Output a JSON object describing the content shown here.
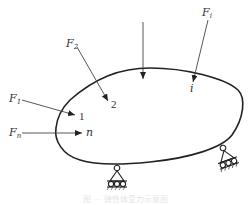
{
  "diagram": {
    "type": "elastic-body-with-applied-forces",
    "colors": {
      "stroke": "#222222",
      "text": "#333333"
    },
    "forces": [
      {
        "id": "F1",
        "label": "F",
        "subscript": "1",
        "point_label": "1"
      },
      {
        "id": "F2",
        "label": "F",
        "subscript": "2",
        "point_label": "2"
      },
      {
        "id": "Fi",
        "label": "F",
        "subscript": "i",
        "point_label": "i"
      },
      {
        "id": "Fn",
        "label": "F",
        "subscript": "n",
        "point_label": "n"
      },
      {
        "id": "F_unlabeled",
        "label": "",
        "subscript": "",
        "point_label": ""
      }
    ],
    "supports": [
      {
        "id": "support-bottom",
        "type": "roller-pin"
      },
      {
        "id": "support-right",
        "type": "roller-pin"
      }
    ],
    "caption": "图 ··· 弹性体受力示意图"
  }
}
